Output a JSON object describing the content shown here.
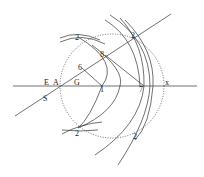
{
  "diagram": {
    "type": "geometric-construction",
    "labels": {
      "E": "E",
      "A": "A",
      "G": "G",
      "S": "S",
      "x": "x",
      "p1": "1",
      "p6": "6",
      "p7": "7",
      "p8": "8",
      "two_tl": "2",
      "two_tr": "2",
      "two_bl": "2",
      "two_br": "2"
    },
    "colors": {
      "stroke": "#333333",
      "text": "#222222"
    }
  }
}
